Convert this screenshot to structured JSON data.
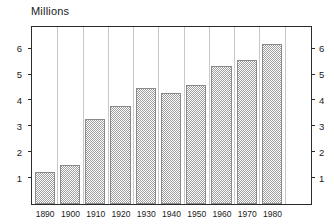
{
  "chart_data": {
    "type": "bar",
    "title": "Millions",
    "xlabel": "",
    "ylabel": "Millions",
    "categories": [
      "1890",
      "1900",
      "1910",
      "1920",
      "1930",
      "1940",
      "1950",
      "1960",
      "1970",
      "1980"
    ],
    "values": [
      1.25,
      1.5,
      3.3,
      3.8,
      4.5,
      4.3,
      4.6,
      5.35,
      5.55,
      6.2
    ],
    "ylim": [
      0,
      6.8
    ],
    "y_ticks": [
      1,
      2,
      3,
      4,
      5,
      6
    ],
    "y_ticks_right": [
      1,
      2,
      3,
      4,
      5,
      6
    ],
    "grid": true,
    "grid_orientation": "vertical",
    "legend": "none",
    "bar_fill": "#9d9d9d",
    "bar_pattern": "checkerboard-dither",
    "axis_color": "#2b2b2b",
    "gridline_color": "#c8c8c8",
    "background": "#ffffff"
  }
}
